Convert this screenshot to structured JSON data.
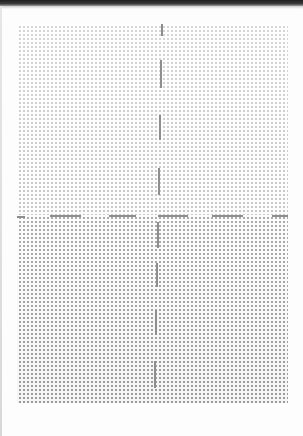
{
  "document": {
    "type": "dot-grid paper scan",
    "width": 303,
    "height": 436,
    "background_color": "#fdfdfd",
    "top_bar_color": "#1e1e1e"
  },
  "grid": {
    "left": 17,
    "top": 24,
    "right": 288,
    "bottom": 403,
    "split_y": 215,
    "dot_pitch": 4,
    "dot_color_top": "#8c8c8c",
    "dot_color_bottom": "#787878"
  },
  "crosshair": {
    "color": "#8e8e8e",
    "thickness": 2,
    "vertical_dashes": [
      {
        "x": 161,
        "y": 24,
        "h": 12
      },
      {
        "x": 160,
        "y": 60,
        "h": 28
      },
      {
        "x": 159,
        "y": 115,
        "h": 25
      },
      {
        "x": 158,
        "y": 168,
        "h": 27
      },
      {
        "x": 157,
        "y": 222,
        "h": 26
      },
      {
        "x": 156,
        "y": 263,
        "h": 24
      },
      {
        "x": 155,
        "y": 310,
        "h": 25
      },
      {
        "x": 154,
        "y": 361,
        "h": 27
      }
    ],
    "horizontal_dashes": [
      {
        "x": 17,
        "y": 216,
        "w": 8
      },
      {
        "x": 50,
        "y": 215,
        "w": 31
      },
      {
        "x": 109,
        "y": 215,
        "w": 27
      },
      {
        "x": 158,
        "y": 215,
        "w": 30
      },
      {
        "x": 212,
        "y": 215,
        "w": 31
      },
      {
        "x": 272,
        "y": 215,
        "w": 16
      }
    ]
  }
}
